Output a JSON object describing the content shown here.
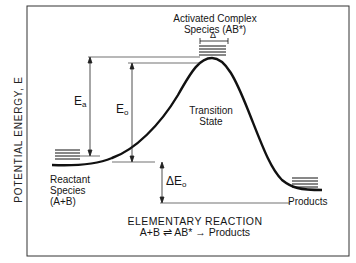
{
  "diagram": {
    "title_line1": "ELEMENTARY REACTION",
    "title_line2": "A+B ⇌ AB* → Products",
    "y_axis_label": "POTENTIAL ENERGY, E",
    "labels": {
      "activated_complex_line1": "Activated Complex",
      "activated_complex_line2": "Species (AB*)",
      "delta_width": "Δ",
      "transition_state_line1": "Transition",
      "transition_state_line2": "State",
      "reactant_line1": "Reactant",
      "reactant_line2": "Species",
      "reactant_line3": "(A+B)",
      "products": "Products",
      "Ea_symbol": "E",
      "Ea_sub": "a",
      "Eo_symbol": "E",
      "Eo_sub": "o",
      "dEo_symbol": "ΔE",
      "dEo_sub": "o"
    },
    "colors": {
      "line": "#111111",
      "frame": "#333333",
      "background": "#ffffff"
    }
  }
}
